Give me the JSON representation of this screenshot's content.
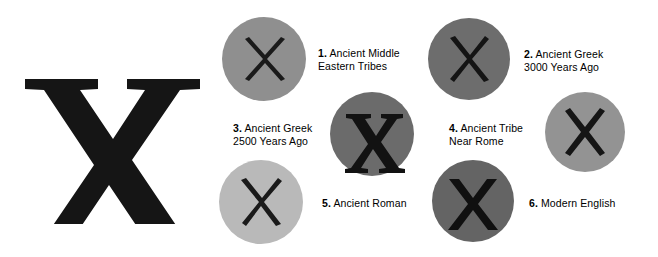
{
  "figure": {
    "hero": {
      "letter": "X",
      "style": "heavy-serif-capital-x",
      "color": "#151515"
    },
    "background_color": "#ffffff",
    "items": [
      {
        "number": "1.",
        "label_line1": "Ancient Middle",
        "label_line2": "Eastern Tribes",
        "circle_color": "#8f8f8f",
        "glyph": "X",
        "glyph_style": "thin-tapered-cross",
        "glyph_color": "#1a1a1a"
      },
      {
        "number": "2.",
        "label_line1": "Ancient Greek",
        "label_line2": "3000 Years Ago",
        "circle_color": "#6d6d6d",
        "glyph": "X",
        "glyph_style": "tapered-cross",
        "glyph_color": "#141414"
      },
      {
        "number": "3.",
        "label_line1": "Ancient Greek",
        "label_line2": "2500 Years Ago",
        "circle_color": "#6b6b6b",
        "glyph": "X",
        "glyph_style": "serif-roman-capital",
        "glyph_color": "#121212"
      },
      {
        "number": "4.",
        "label_line1": "Ancient Tribe",
        "label_line2": "Near Rome",
        "circle_color": "#939393",
        "glyph": "X",
        "glyph_style": "bold-straight-cross",
        "glyph_color": "#151515"
      },
      {
        "number": "5.",
        "label_line1": "Ancient Roman",
        "label_line2": "",
        "circle_color": "#b9b9b9",
        "glyph": "X",
        "glyph_style": "thin-tapered-cross",
        "glyph_color": "#1a1a1a"
      },
      {
        "number": "6.",
        "label_line1": "Modern English",
        "label_line2": "",
        "circle_color": "#646464",
        "glyph": "X",
        "glyph_style": "bold-sans-capital",
        "glyph_color": "#101010"
      }
    ]
  }
}
